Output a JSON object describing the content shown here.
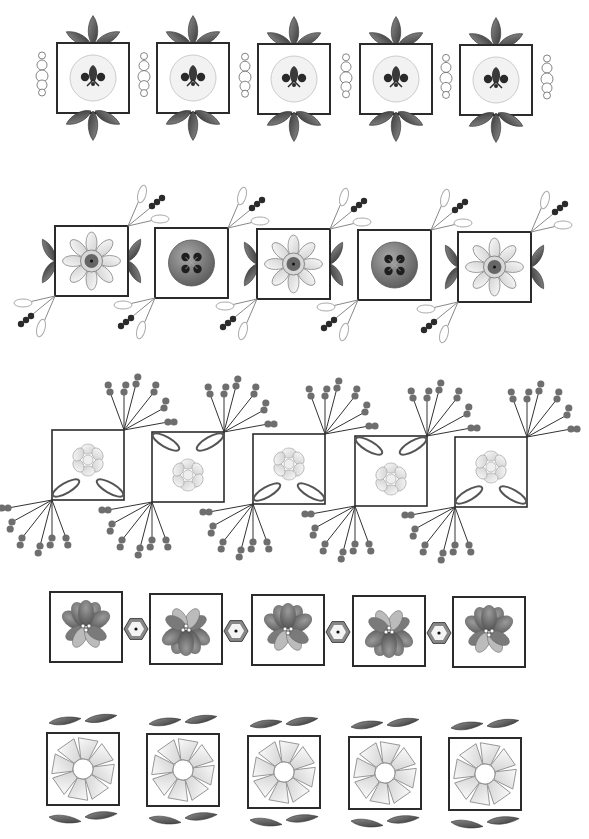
{
  "colors": {
    "frame": "#2b2b2b",
    "leaf": "#6a6a6a",
    "leaf_dark": "#3e3e3e",
    "light_fill": "#e6e6e6",
    "button": "#8a8a8a",
    "bead": "#6e6e6e",
    "bead_dark": "#2a2a2a"
  },
  "rows": [
    {
      "name": "row-fleur-buttons",
      "motif": "fleur-de-lis button in square with leaf sprays and bead chains",
      "count": 5,
      "tiles": [
        {
          "x": 57,
          "y": 43
        },
        {
          "x": 157,
          "y": 43
        },
        {
          "x": 258,
          "y": 44
        },
        {
          "x": 360,
          "y": 44
        },
        {
          "x": 460,
          "y": 45
        }
      ]
    },
    {
      "name": "row-daisy-and-buttons",
      "motif": "alternating daisy squares and four-hole button squares with loop-and-bead sprays",
      "count": 5,
      "tiles": [
        {
          "x": 55,
          "y": 226,
          "type": "daisy"
        },
        {
          "x": 155,
          "y": 228,
          "type": "button"
        },
        {
          "x": 257,
          "y": 229,
          "type": "daisy"
        },
        {
          "x": 358,
          "y": 230,
          "type": "button"
        },
        {
          "x": 458,
          "y": 232,
          "type": "daisy"
        }
      ]
    },
    {
      "name": "row-linked-squares",
      "motif": "interlinked squares with shell clusters, loops and bead-tipped stems",
      "count": 5,
      "tiles": [
        {
          "x": 52,
          "y": 430
        },
        {
          "x": 152,
          "y": 432
        },
        {
          "x": 253,
          "y": 434
        },
        {
          "x": 355,
          "y": 436
        },
        {
          "x": 455,
          "y": 437
        }
      ]
    },
    {
      "name": "row-flowers-hexagons",
      "motif": "flower squares joined by hexagon beads",
      "count": 5,
      "tiles": [
        {
          "x": 50,
          "y": 592
        },
        {
          "x": 150,
          "y": 594
        },
        {
          "x": 252,
          "y": 595
        },
        {
          "x": 353,
          "y": 596
        },
        {
          "x": 453,
          "y": 597
        }
      ]
    },
    {
      "name": "row-pinwheels",
      "motif": "pinwheel flowers in squares with paired leaves",
      "count": 5,
      "tiles": [
        {
          "x": 47,
          "y": 733
        },
        {
          "x": 147,
          "y": 734
        },
        {
          "x": 248,
          "y": 736
        },
        {
          "x": 349,
          "y": 737
        },
        {
          "x": 449,
          "y": 738
        }
      ]
    }
  ]
}
